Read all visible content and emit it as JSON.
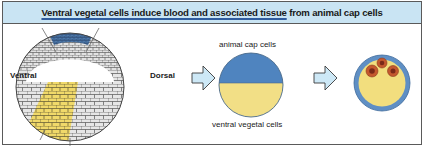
{
  "title": {
    "part1": "Ventral vegetal cells",
    "part2": " induce blood and associated tissue",
    "part3": " from animal cap cells"
  },
  "embryo": {
    "left_label": "Ventral",
    "right_label": "Dorsal",
    "regions": [
      "animal cap (blue)",
      "ventral vegetal (yellow)",
      "other cells (grey)"
    ]
  },
  "explant": {
    "top_label": "animal cap cells",
    "bottom_label": "ventral vegetal cells"
  },
  "result": {
    "description": "explant with blood cell clusters"
  },
  "colors": {
    "title_bg": "#c9e4f3",
    "animal_cap_blue": "#4f84bf",
    "vegetal_yellow": "#f2df86",
    "arrow_fill": "#cde8f6",
    "blood_red": "#b84a2a",
    "cell_grey": "#d8d8d8"
  },
  "icons": [
    "right-arrow-icon",
    "right-arrow-icon"
  ]
}
